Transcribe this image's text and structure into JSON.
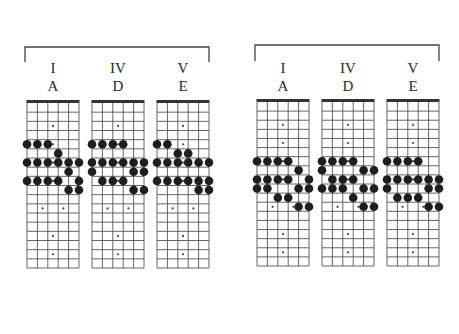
{
  "colors": {
    "background": "#ffffff",
    "line": "#555555",
    "nut": "#333333",
    "bead": "#1e1e1e",
    "inlay": "#444444",
    "label": "#2a2a2a"
  },
  "fretboard_spec": {
    "strings": 6,
    "frets": 18,
    "inlay_frets_single": [
      3,
      5,
      7,
      9,
      15,
      17
    ],
    "inlay_frets_double": [
      12
    ]
  },
  "groups": [
    {
      "name": "left",
      "bracket": {
        "x1": 25,
        "x2": 209,
        "y": 47,
        "leg_bottom": 62
      },
      "board_top": 100,
      "board_bottom": 268,
      "diagrams": [
        {
          "numeral": "I",
          "key": "A",
          "x_left": 27,
          "notes": [
            {
              "fret": 5,
              "strings": [
                0,
                1,
                2
              ]
            },
            {
              "fret": 6,
              "strings": [
                3
              ]
            },
            {
              "fret": 7,
              "strings": [
                0,
                1,
                2,
                3,
                4,
                5
              ]
            },
            {
              "fret": 8,
              "strings": [
                4
              ]
            },
            {
              "fret": 9,
              "strings": [
                0,
                1,
                2,
                3,
                5
              ]
            },
            {
              "fret": 10,
              "strings": [
                4,
                5
              ]
            }
          ]
        },
        {
          "numeral": "IV",
          "key": "D",
          "x_left": 92,
          "notes": [
            {
              "fret": 5,
              "strings": [
                0,
                1,
                2,
                3
              ]
            },
            {
              "fret": 7,
              "strings": [
                0,
                1,
                2,
                3,
                4,
                5
              ]
            },
            {
              "fret": 8,
              "strings": [
                0,
                4,
                5
              ]
            },
            {
              "fret": 9,
              "strings": [
                1,
                2,
                3
              ]
            },
            {
              "fret": 10,
              "strings": [
                4,
                5
              ]
            }
          ]
        },
        {
          "numeral": "V",
          "key": "E",
          "x_left": 157,
          "notes": [
            {
              "fret": 5,
              "strings": [
                0,
                1
              ]
            },
            {
              "fret": 6,
              "strings": [
                2,
                3
              ]
            },
            {
              "fret": 7,
              "strings": [
                0,
                1,
                2,
                3,
                4,
                5
              ]
            },
            {
              "fret": 9,
              "strings": [
                0,
                1,
                2,
                3,
                4,
                5
              ]
            },
            {
              "fret": 10,
              "strings": [
                4,
                5
              ]
            }
          ]
        }
      ]
    },
    {
      "name": "right",
      "bracket": {
        "x1": 255,
        "x2": 439,
        "y": 45,
        "leg_bottom": 61
      },
      "board_top": 99,
      "board_bottom": 266,
      "diagrams": [
        {
          "numeral": "I",
          "key": "A",
          "x_left": 257,
          "notes": [
            {
              "fret": 7,
              "strings": [
                0,
                1,
                2,
                3
              ]
            },
            {
              "fret": 8,
              "strings": [
                4
              ]
            },
            {
              "fret": 9,
              "strings": [
                0,
                1,
                2,
                3,
                5
              ]
            },
            {
              "fret": 10,
              "strings": [
                0,
                1,
                4,
                5
              ]
            },
            {
              "fret": 11,
              "strings": [
                2,
                3
              ]
            },
            {
              "fret": 12,
              "strings": [
                4,
                5
              ]
            }
          ]
        },
        {
          "numeral": "IV",
          "key": "D",
          "x_left": 322,
          "notes": [
            {
              "fret": 7,
              "strings": [
                0,
                1,
                2,
                3
              ]
            },
            {
              "fret": 8,
              "strings": [
                0,
                4,
                5
              ]
            },
            {
              "fret": 9,
              "strings": [
                1,
                2,
                3
              ]
            },
            {
              "fret": 10,
              "strings": [
                0,
                1,
                2,
                4,
                5
              ]
            },
            {
              "fret": 11,
              "strings": [
                3
              ]
            },
            {
              "fret": 12,
              "strings": [
                4,
                5
              ]
            }
          ]
        },
        {
          "numeral": "V",
          "key": "E",
          "x_left": 387,
          "notes": [
            {
              "fret": 7,
              "strings": [
                0,
                1,
                2,
                3
              ]
            },
            {
              "fret": 9,
              "strings": [
                0,
                1,
                2,
                3,
                4,
                5
              ]
            },
            {
              "fret": 10,
              "strings": [
                0,
                4,
                5
              ]
            },
            {
              "fret": 11,
              "strings": [
                1,
                2,
                3
              ]
            },
            {
              "fret": 12,
              "strings": [
                4,
                5
              ]
            }
          ]
        }
      ]
    }
  ],
  "labels": {
    "numeral_y": 73,
    "key_y": 91
  },
  "board_width": 52
}
